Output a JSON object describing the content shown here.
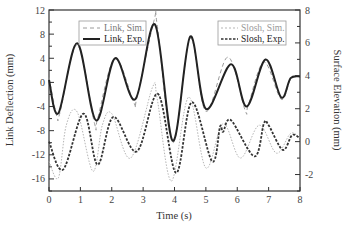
{
  "chart_data": {
    "type": "line",
    "title": "",
    "xlabel": "Time (s)",
    "ylabel_left": "Link Deflection (mm)",
    "ylabel_right": "Surface Elevation (mm)",
    "xlim": [
      0,
      8
    ],
    "ylim_left": [
      -18,
      12
    ],
    "ylim_right": [
      -3,
      8
    ],
    "x_ticks": [
      0,
      1,
      2,
      3,
      4,
      5,
      6,
      7,
      8
    ],
    "y_ticks_left": [
      12,
      8,
      4,
      0,
      -4,
      -8,
      -12,
      -16
    ],
    "y_ticks_right": [
      8,
      6,
      4,
      2,
      0,
      -2
    ],
    "grid": false,
    "legends": [
      {
        "position": "upper-left",
        "entries": [
          "Link, Sim.",
          "Link, Exp."
        ]
      },
      {
        "position": "upper-right",
        "entries": [
          "Slosh, Sim.",
          "Slosh, Exp."
        ]
      }
    ],
    "series": [
      {
        "name": "Link, Sim.",
        "axis": "left",
        "style": "dashed",
        "color": "#9a9a9a",
        "x": [
          0,
          0.25,
          0.35,
          0.9,
          1.45,
          1.55,
          2.1,
          2.7,
          2.8,
          3.35,
          3.45,
          3.95,
          4.5,
          5.0,
          5.7,
          6.25,
          6.35,
          6.85,
          7.4,
          7.7,
          8.0
        ],
        "y": [
          0.8,
          -5.6,
          -5.0,
          6.2,
          -6.8,
          -6.0,
          4.0,
          -3.3,
          -2.6,
          10.3,
          9.5,
          -10.0,
          7.3,
          -4.8,
          4.2,
          -4.6,
          -3.8,
          3.4,
          -2.8,
          0.5,
          1.0
        ]
      },
      {
        "name": "Link, Exp.",
        "axis": "left",
        "style": "solid",
        "color": "#222222",
        "x": [
          0,
          0.3,
          0.9,
          1.5,
          2.1,
          2.75,
          3.38,
          3.95,
          4.5,
          5.0,
          5.8,
          6.3,
          6.9,
          7.4,
          7.7,
          8.0
        ],
        "y": [
          0.4,
          -5.1,
          6.5,
          -6.3,
          4.0,
          -2.8,
          9.6,
          -9.7,
          7.6,
          -4.4,
          3.0,
          -4.0,
          3.8,
          -2.5,
          0.7,
          1.0
        ]
      },
      {
        "name": "Slosh, Sim.",
        "axis": "right",
        "style": "dotted",
        "color": "#b5b5b5",
        "x": [
          0,
          0.3,
          0.55,
          0.9,
          1.4,
          1.7,
          2.0,
          2.6,
          3.3,
          3.45,
          3.9,
          4.45,
          5.0,
          5.55,
          6.1,
          6.7,
          7.25,
          7.7,
          8.0
        ],
        "y": [
          -1.2,
          -2.2,
          1.0,
          1.8,
          -1.8,
          1.0,
          1.7,
          -1.0,
          3.3,
          2.6,
          -2.4,
          2.7,
          -1.6,
          1.1,
          -1.0,
          1.0,
          -0.7,
          0.5,
          0.2
        ]
      },
      {
        "name": "Slosh, Exp.",
        "axis": "right",
        "style": "short-dash",
        "color": "#333333",
        "x": [
          0,
          0.45,
          1.1,
          1.55,
          2.05,
          2.8,
          3.47,
          4.05,
          4.55,
          5.2,
          5.45,
          5.55,
          5.8,
          6.55,
          6.85,
          7.0,
          7.45,
          7.75,
          8.0
        ],
        "y": [
          0.0,
          -1.7,
          1.7,
          -1.4,
          1.5,
          -0.6,
          2.9,
          -1.9,
          2.4,
          -1.2,
          0.9,
          0.6,
          1.3,
          -0.9,
          1.1,
          1.0,
          -0.5,
          0.4,
          0.2
        ]
      }
    ]
  },
  "axes": {
    "x_label": "Time (s)",
    "y_left_label": "Link Deflection (mm)",
    "y_right_label": "Surface Elevation (mm)",
    "x_tick_labels": [
      "0",
      "1",
      "2",
      "3",
      "4",
      "5",
      "6",
      "7",
      "8"
    ],
    "y_left_tick_labels": [
      "12",
      "8",
      "4",
      "0",
      "-4",
      "-8",
      "-12",
      "-16"
    ],
    "y_right_tick_labels": [
      "8",
      "6",
      "4",
      "2",
      "0",
      "-2"
    ]
  },
  "legend_left": {
    "sim_label": "Link, Sim.",
    "exp_label": "Link, Exp."
  },
  "legend_right": {
    "sim_label": "Slosh, Sim.",
    "exp_label": "Slosh, Exp."
  }
}
